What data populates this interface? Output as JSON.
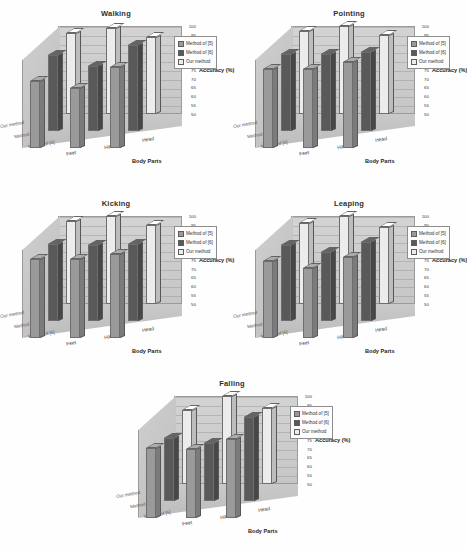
{
  "axis": {
    "y_title": "Accuracy (%)",
    "x_title": "Body Parts",
    "y_ticks": [
      "100",
      "95",
      "90",
      "85",
      "80",
      "75",
      "70",
      "65",
      "60",
      "55",
      "50"
    ],
    "x_categories": [
      "Feet",
      "Hands",
      "Head"
    ],
    "z_categories": [
      "Our method",
      "Method of [6]",
      "Method of [5]"
    ]
  },
  "legend": {
    "entries": [
      "Method of [5]",
      "Method of [6]",
      "Our method"
    ],
    "colors": [
      "#9a9a9a",
      "#595959",
      "#ececec"
    ]
  },
  "chart_data": [
    {
      "type": "bar",
      "title": "Walking",
      "xlabel": "Body Parts",
      "ylabel": "Accuracy (%)",
      "ylim": [
        50,
        100
      ],
      "categories": [
        "Feet",
        "Hands",
        "Head"
      ],
      "series": [
        {
          "name": "Method of [5]",
          "values": [
            88,
            84,
            96
          ]
        },
        {
          "name": "Method of [6]",
          "values": [
            93,
            87,
            99
          ]
        },
        {
          "name": "Our method",
          "values": [
            96,
            99,
            94
          ]
        }
      ]
    },
    {
      "type": "bar",
      "title": "Pointing",
      "xlabel": "Body Parts",
      "ylabel": "Accuracy (%)",
      "ylim": [
        50,
        100
      ],
      "categories": [
        "Feet",
        "Hands",
        "Head"
      ],
      "series": [
        {
          "name": "Method of [5]",
          "values": [
            95,
            95,
            99
          ]
        },
        {
          "name": "Method of [6]",
          "values": [
            94,
            94,
            95
          ]
        },
        {
          "name": "Our method",
          "values": [
            97,
            100,
            95
          ]
        }
      ]
    },
    {
      "type": "bar",
      "title": "Kicking",
      "xlabel": "Body Parts",
      "ylabel": "Accuracy (%)",
      "ylim": [
        50,
        100
      ],
      "categories": [
        "Feet",
        "Hands",
        "Head"
      ],
      "series": [
        {
          "name": "Method of [5]",
          "values": [
            95,
            95,
            98
          ]
        },
        {
          "name": "Method of [6]",
          "values": [
            94,
            93,
            94
          ]
        },
        {
          "name": "Our method",
          "values": [
            97,
            100,
            95
          ]
        }
      ]
    },
    {
      "type": "bar",
      "title": "Leaping",
      "xlabel": "Body Parts",
      "ylabel": "Accuracy (%)",
      "ylim": [
        50,
        100
      ],
      "categories": [
        "Feet",
        "Hands",
        "Head"
      ],
      "series": [
        {
          "name": "Method of [5]",
          "values": [
            94,
            90,
            96
          ]
        },
        {
          "name": "Method of [6]",
          "values": [
            93,
            89,
            95
          ]
        },
        {
          "name": "Our method",
          "values": [
            96,
            100,
            94
          ]
        }
      ]
    },
    {
      "type": "bar",
      "title": "Falling",
      "xlabel": "Body Parts",
      "ylabel": "Accuracy (%)",
      "ylim": [
        50,
        100
      ],
      "categories": [
        "Feet",
        "Hands",
        "Head"
      ],
      "series": [
        {
          "name": "Method of [5]",
          "values": [
            90,
            89,
            95
          ]
        },
        {
          "name": "Method of [6]",
          "values": [
            86,
            83,
            98
          ]
        },
        {
          "name": "Our method",
          "values": [
            92,
            100,
            93
          ]
        }
      ]
    }
  ]
}
